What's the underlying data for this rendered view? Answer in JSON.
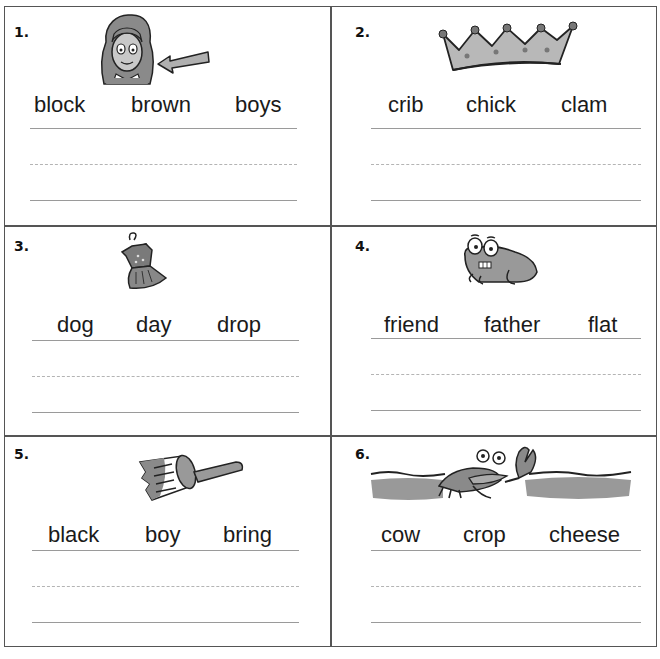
{
  "worksheet": {
    "panels": [
      {
        "number": "1.",
        "picture": "girl-with-arrow-pointing-to-brown-hair",
        "words": [
          "block",
          "brown",
          "boys"
        ]
      },
      {
        "number": "2.",
        "picture": "crown",
        "words": [
          "crib",
          "chick",
          "clam"
        ]
      },
      {
        "number": "3.",
        "picture": "dress-on-hanger",
        "words": [
          "dog",
          "day",
          "drop"
        ]
      },
      {
        "number": "4.",
        "picture": "frog",
        "words": [
          "friend",
          "father",
          "flat"
        ]
      },
      {
        "number": "5.",
        "picture": "paintbrush",
        "words": [
          "black",
          "boy",
          "bring"
        ]
      },
      {
        "number": "6.",
        "picture": "crab-crawling",
        "words": [
          "cow",
          "crop",
          "cheese"
        ]
      }
    ],
    "colors": {
      "border": "#555555",
      "ink": "#1a1a1a",
      "fill_gray": "#9e9e9e",
      "rule_line": "#9a9a9a"
    }
  }
}
